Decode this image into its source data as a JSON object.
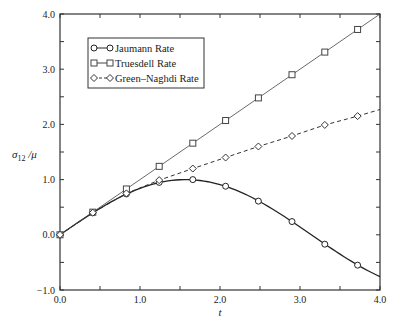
{
  "chart_data": {
    "type": "line",
    "title": "",
    "xlabel": "t",
    "ylabel": "σ12 / μ",
    "ylabel_parts": {
      "base": "σ",
      "sub": "12",
      "rest": " /μ"
    },
    "xlim": [
      0.0,
      4.0
    ],
    "ylim": [
      -1.0,
      4.0
    ],
    "xticks": [
      0.0,
      1.0,
      2.0,
      3.0,
      4.0
    ],
    "xtick_labels": [
      "0.0",
      "1.0",
      "2.0",
      "3.0",
      "4.0"
    ],
    "yticks": [
      -1.0,
      0.0,
      1.0,
      2.0,
      3.0,
      4.0
    ],
    "ytick_labels": [
      "-1.0",
      "0.0",
      "1.0",
      "2.0",
      "3.0",
      "4.0"
    ],
    "minor_tick_step": 0.5,
    "grid": false,
    "legend_position": "upper left",
    "marker_t": [
      0.0,
      0.41,
      0.83,
      1.24,
      1.66,
      2.07,
      2.48,
      2.9,
      3.31,
      3.72
    ],
    "series": [
      {
        "name": "Jaumann Rate",
        "marker": "circle",
        "line": "solid",
        "line_width": 1.3,
        "color": "#222222",
        "curve": "sin(t)",
        "values": [
          0.0,
          0.4,
          0.74,
          0.95,
          1.0,
          0.88,
          0.61,
          0.24,
          -0.17,
          -0.55
        ],
        "end_value": -0.76
      },
      {
        "name": "Truesdell Rate",
        "marker": "square",
        "line": "solid",
        "line_width": 0.8,
        "color": "#444444",
        "curve": "t",
        "values": [
          0.0,
          0.41,
          0.83,
          1.24,
          1.66,
          2.07,
          2.48,
          2.9,
          3.31,
          3.72
        ],
        "end_value": 4.0
      },
      {
        "name": "Green–Naghdi Rate",
        "marker": "diamond",
        "line": "dashed",
        "line_width": 1.0,
        "color": "#333333",
        "curve": "",
        "values": [
          0.0,
          0.4,
          0.75,
          0.99,
          1.2,
          1.4,
          1.6,
          1.79,
          1.99,
          2.15
        ],
        "end_value": 2.27
      }
    ]
  }
}
